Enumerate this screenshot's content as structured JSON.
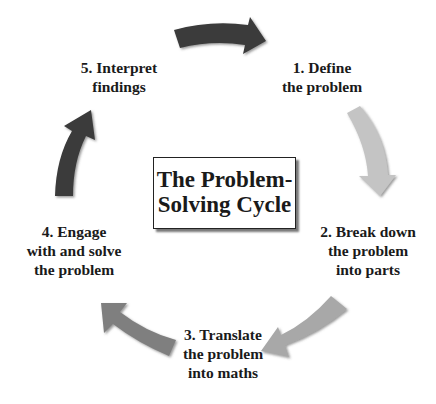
{
  "diagram": {
    "title": {
      "line1": "The Problem-",
      "line2": "Solving Cycle"
    },
    "steps": [
      {
        "number": 1,
        "line1": "1. Define",
        "line2": "the problem"
      },
      {
        "number": 2,
        "line1": "2. Break down",
        "line2": "the problem",
        "line3": "into parts"
      },
      {
        "number": 3,
        "line1": "3. Translate",
        "line2": "the problem",
        "line3": "into maths"
      },
      {
        "number": 4,
        "line1": "4. Engage",
        "line2": "with and solve",
        "line3": "the problem"
      },
      {
        "number": 5,
        "line1": "5. Interpret",
        "line2": "findings"
      }
    ],
    "arrows": [
      {
        "from": 5,
        "to": 1,
        "color": "#3a3a3a",
        "direction": "right"
      },
      {
        "from": 1,
        "to": 2,
        "color": "#c4c4c4",
        "direction": "down"
      },
      {
        "from": 2,
        "to": 3,
        "color": "#a8a8a8",
        "direction": "down-left"
      },
      {
        "from": 3,
        "to": 4,
        "color": "#7f7f7f",
        "direction": "up-left"
      },
      {
        "from": 4,
        "to": 5,
        "color": "#3a3a3a",
        "direction": "up"
      }
    ],
    "colors": {
      "background": "#ffffff",
      "text": "#1a1a1a",
      "box_border": "#222222",
      "box_shadow": "#777777"
    }
  }
}
